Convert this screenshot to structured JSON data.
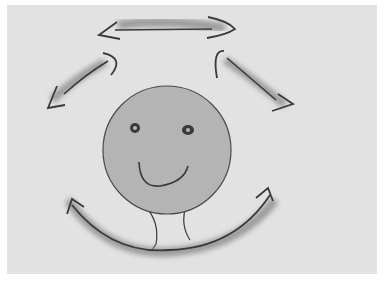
{
  "diagram": {
    "colors": {
      "background": "#ffffff",
      "panel": "#e2e2e2",
      "face_fill": "#b4b4b4",
      "stroke": "#3a3a3a",
      "shadow": "#8a8a8a"
    },
    "elements": [
      {
        "name": "face",
        "shape": "circle",
        "cx": 167,
        "cy": 150,
        "r": 64
      },
      {
        "name": "top-arrow",
        "direction": "double-headed horizontal"
      },
      {
        "name": "upper-left-arrow",
        "direction": "curved, pointing down-left"
      },
      {
        "name": "upper-right-arrow",
        "direction": "curved, pointing down-right"
      },
      {
        "name": "bottom-arrow",
        "direction": "double-headed curved arc under chin"
      }
    ]
  }
}
